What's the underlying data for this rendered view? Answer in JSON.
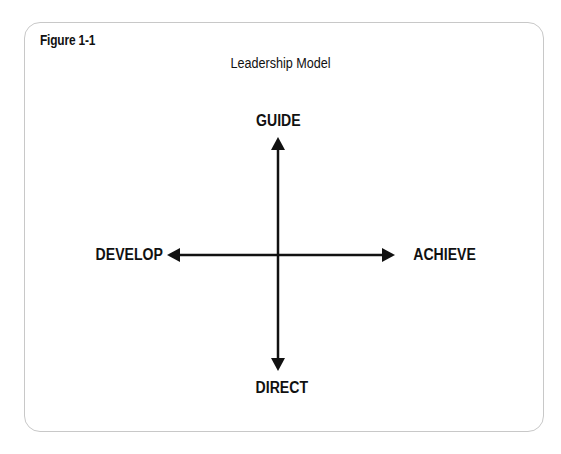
{
  "figure": {
    "label": "Figure 1-1",
    "title": "Leadership Model"
  },
  "diagram": {
    "type": "four-direction-axes",
    "top_label": "GUIDE",
    "bottom_label": "DIRECT",
    "left_label": "DEVELOP",
    "right_label": "ACHIEVE",
    "colors": {
      "ink": "#111111",
      "border": "#c8c8c8"
    }
  }
}
